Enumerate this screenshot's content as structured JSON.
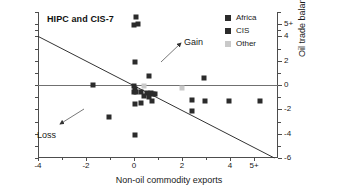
{
  "chart_data": {
    "type": "scatter",
    "title": "HIPC and CIS-7",
    "xlabel": "Non-oil commodity exports",
    "ylabel": "Oil trade balance",
    "xlim": [
      -4,
      6
    ],
    "ylim": [
      -6,
      6
    ],
    "grid": false,
    "legend_position": "top-right",
    "x_ticks": [
      {
        "value": -4,
        "label": "-4"
      },
      {
        "value": -2,
        "label": "-2"
      },
      {
        "value": 0,
        "label": "0"
      },
      {
        "value": 2,
        "label": "2"
      },
      {
        "value": 4,
        "label": "4"
      },
      {
        "value": 5,
        "label": "5+"
      }
    ],
    "x_minor_ticks": [
      -3,
      -1,
      1,
      3
    ],
    "y_ticks": [
      {
        "value": 5,
        "label": "5+"
      },
      {
        "value": 4,
        "label": "4"
      },
      {
        "value": 2,
        "label": "2"
      },
      {
        "value": 0,
        "label": "0"
      },
      {
        "value": -2,
        "label": "-2"
      },
      {
        "value": -4,
        "label": "-4"
      },
      {
        "value": -6,
        "label": "-6"
      }
    ],
    "y_minor_ticks": [
      6,
      4.5,
      3,
      1,
      -1,
      -3,
      -5
    ],
    "left_axis_ticks": [
      6,
      5,
      4.5,
      4,
      3,
      2,
      1,
      0,
      -1,
      -2,
      -3,
      -4,
      -5,
      -6
    ],
    "series": [
      {
        "name": "Africa",
        "color": "#2b2b2b",
        "points": [
          [
            0.1,
            5.6
          ],
          [
            0.0,
            4.95
          ],
          [
            0.18,
            5.05
          ],
          [
            0.05,
            1.85
          ],
          [
            0.62,
            0.7
          ],
          [
            -1.7,
            -0.02
          ],
          [
            0.02,
            -0.05
          ],
          [
            0.05,
            -0.3
          ],
          [
            -0.02,
            -0.55
          ],
          [
            0.1,
            -0.58
          ],
          [
            0.28,
            -0.6
          ],
          [
            0.55,
            -0.62
          ],
          [
            0.7,
            -0.68
          ],
          [
            0.78,
            -0.72
          ],
          [
            0.86,
            -0.75
          ],
          [
            0.42,
            -0.92
          ],
          [
            0.64,
            -0.95
          ],
          [
            0.05,
            -1.55
          ],
          [
            0.3,
            -1.52
          ],
          [
            0.74,
            -1.35
          ],
          [
            2.4,
            -1.25
          ],
          [
            2.96,
            -1.3
          ],
          [
            2.9,
            0.6
          ],
          [
            2.4,
            -2.15
          ],
          [
            -1.05,
            -2.6
          ],
          [
            0.05,
            -4.1
          ],
          [
            3.95,
            -1.28
          ],
          [
            5.25,
            -1.28
          ]
        ]
      },
      {
        "name": "CIS",
        "color": "#2b2b2b",
        "points": []
      },
      {
        "name": "Other",
        "color": "#c9c9c9",
        "points": [
          [
            0.42,
            -0.08
          ],
          [
            1.98,
            -0.22
          ]
        ]
      }
    ],
    "trendline": {
      "x_start": -4,
      "y_start": 4.0,
      "x_end": 5.85,
      "y_end": -6.0,
      "color": "#333333"
    },
    "annotations": [
      {
        "label": "Gain",
        "text_x": 184,
        "text_y": 38,
        "arrow_from_x": 161,
        "arrow_from_y": 62,
        "arrow_to_x": 181,
        "arrow_to_y": 43
      },
      {
        "label": "Loss",
        "text_x": 37,
        "text_y": 131,
        "arrow_from_x": 84,
        "arrow_from_y": 109,
        "arrow_to_x": 60,
        "arrow_to_y": 124
      }
    ],
    "legend": [
      {
        "label": "Africa",
        "color": "#2b2b2b"
      },
      {
        "label": "CIS",
        "color": "#2b2b2b"
      },
      {
        "label": "Other",
        "color": "#c9c9c9"
      }
    ]
  }
}
